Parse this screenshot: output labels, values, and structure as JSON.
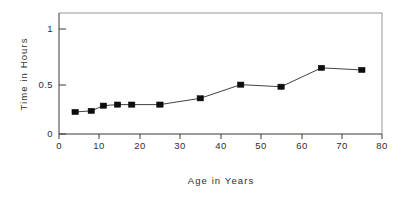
{
  "chart_data": {
    "type": "line",
    "title": "",
    "xlabel": "Age in Years",
    "ylabel": "Time in Hours",
    "xlim": [
      0,
      80
    ],
    "ylim": [
      0,
      1.12
    ],
    "xticks": [
      0,
      10,
      20,
      30,
      40,
      50,
      60,
      70,
      80
    ],
    "xtick_labels": [
      "0",
      "10",
      "20",
      "30",
      "40",
      "50",
      "60",
      "70",
      "80"
    ],
    "yticks": [
      0,
      0.5,
      1
    ],
    "ytick_labels": [
      "0",
      "0.5",
      "1"
    ],
    "grid": false,
    "legend": false,
    "marker": "filled-square",
    "series": [
      {
        "name": "Time in Hours",
        "color": "#0d0d0d",
        "x": [
          4,
          8,
          11,
          14.5,
          18,
          25,
          35,
          45,
          55,
          65,
          75
        ],
        "values": [
          0.21,
          0.22,
          0.27,
          0.28,
          0.28,
          0.28,
          0.34,
          0.47,
          0.45,
          0.63,
          0.61
        ]
      }
    ]
  },
  "labels": {
    "x_axis_title": "Age in Years",
    "y_axis_title": "Time in Hours"
  }
}
